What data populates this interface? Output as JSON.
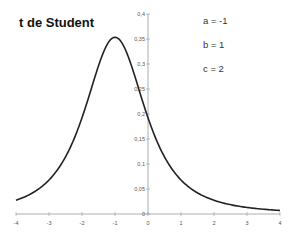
{
  "chart_data": {
    "type": "line",
    "title": "t de Student",
    "xlabel": "",
    "ylabel": "",
    "xlim": [
      -4,
      4
    ],
    "ylim": [
      0,
      0.4
    ],
    "x_ticks": [
      "-4",
      "-3",
      "-2",
      "-1",
      "0",
      "1",
      "2",
      "3",
      "4"
    ],
    "y_ticks": [
      "0",
      "0,05",
      "0,1",
      "0,15",
      "0,2",
      "0,25",
      "0,3",
      "0,35",
      "0,4"
    ],
    "annotations": [
      "a = -1",
      "b = 1",
      "c = 2"
    ],
    "grid": false,
    "legend": null,
    "params": {
      "a": -1,
      "b": 1,
      "c": 2
    },
    "series": [
      {
        "name": "t de Student (a=-1, b=1, c=2)",
        "x": [
          -4,
          -3.5,
          -3,
          -2.5,
          -2,
          -1.5,
          -1,
          -0.5,
          0,
          0.5,
          1,
          1.5,
          2,
          2.5,
          3,
          3.5,
          4
        ],
        "values": [
          0.027,
          0.04,
          0.064,
          0.107,
          0.192,
          0.302,
          0.354,
          0.302,
          0.192,
          0.107,
          0.064,
          0.04,
          0.027,
          0.019,
          0.014,
          0.011,
          0.008
        ]
      }
    ],
    "line_color": "#222222"
  }
}
